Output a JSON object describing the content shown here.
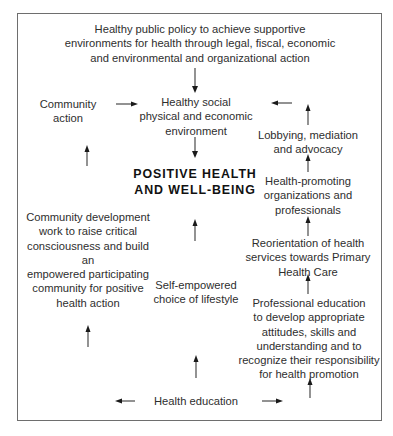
{
  "diagram": {
    "type": "flow-diagram",
    "frame": {
      "border_color": "#6e6e6e"
    },
    "nodes": {
      "public_policy": "Healthy public policy to achieve supportive\nenvironments for health through legal, fiscal, economic\nand environmental and organizational action",
      "community_action": "Community action",
      "healthy_environment": "Healthy social\nphysical and economic\nenvironment",
      "lobbying": "Lobbying, mediation\nand advocacy",
      "positive_health": "POSITIVE HEALTH\nAND WELL-BEING",
      "health_promoting_orgs": "Health-promoting\norganizations and\nprofessionals",
      "community_development": "Community development\nwork to raise critical\nconsciousness and build an\nempowered participating\ncommunity for positive\nhealth action",
      "reorientation": "Reorientation of health\nservices towards Primary\nHealth Care",
      "self_empowered": "Self-empowered\nchoice of lifestyle",
      "professional_education": "Professional education\nto develop appropriate\nattitudes, skills and\nunderstanding and to\nrecognize their responsibility\nfor health promotion",
      "health_education": "Health education"
    },
    "edges": [
      {
        "from": "public_policy",
        "to": "healthy_environment",
        "direction": "down"
      },
      {
        "from": "community_action",
        "to": "healthy_environment",
        "direction": "right"
      },
      {
        "from": "lobbying",
        "to": "healthy_environment",
        "direction": "left"
      },
      {
        "from": "healthy_environment",
        "to": "positive_health",
        "direction": "down"
      },
      {
        "from": "community_development",
        "to": "community_action",
        "direction": "up"
      },
      {
        "from": "health_education",
        "to": "community_development",
        "direction": "up"
      },
      {
        "from": "self_empowered",
        "to": "positive_health",
        "direction": "up"
      },
      {
        "from": "health_education",
        "to": "self_empowered",
        "direction": "up"
      },
      {
        "from": "health_promoting_orgs",
        "to": "lobbying",
        "direction": "up"
      },
      {
        "from": "lobbying",
        "to": "top-right",
        "direction": "up"
      },
      {
        "from": "reorientation",
        "to": "health_promoting_orgs",
        "direction": "up"
      },
      {
        "from": "professional_education",
        "to": "reorientation",
        "direction": "up"
      },
      {
        "from": "health_education",
        "to": "professional_education",
        "direction": "up"
      },
      {
        "from": "health_education",
        "to": "left",
        "direction": "left"
      },
      {
        "from": "health_education",
        "to": "right",
        "direction": "right"
      }
    ]
  }
}
